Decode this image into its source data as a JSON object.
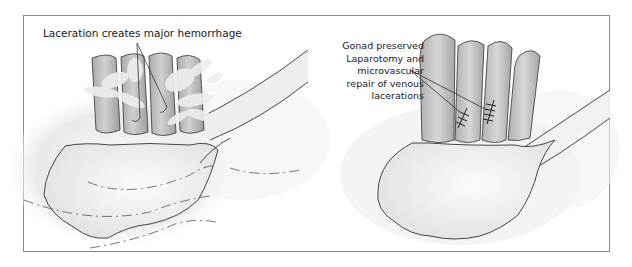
{
  "figure": {
    "panels": [
      {
        "id": "left",
        "title": "Laceration creates major hemorrhage",
        "vein_count": 4,
        "state": "hemorrhage"
      },
      {
        "id": "right",
        "label_lines": [
          "Gonad preserved",
          "Laparotomy and",
          "microvascular",
          "repair of venous",
          "lacerations"
        ],
        "vein_count": 4,
        "sutured_veins": 2,
        "state": "repaired"
      }
    ],
    "colors": {
      "frame": "#8a8a8a",
      "vein_fill": "#bdbdbd",
      "vein_stroke": "#333333",
      "blood_splash": "#e6e6e6",
      "organ_fill": "#ededed",
      "background_shadow": "#d6d6d6"
    }
  }
}
